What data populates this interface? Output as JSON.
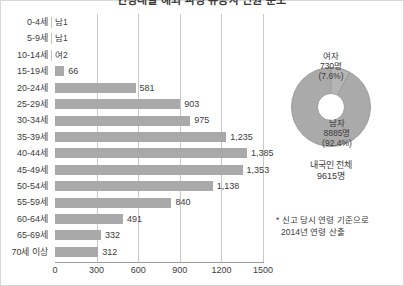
{
  "chart_data": {
    "type": "bar",
    "title": "연령대별 해외 파병 유공자 인원 분포",
    "orientation": "horizontal",
    "xlabel": "",
    "ylabel": "",
    "xlim": [
      0,
      1500
    ],
    "xticks": [
      0,
      300,
      600,
      900,
      1200,
      1500
    ],
    "xtick_labels": [
      "0",
      "300",
      "600",
      "900",
      "1200",
      "1500"
    ],
    "grid": true,
    "legend": "none",
    "bar_color": "#a9a9a9",
    "categories": [
      "0-4세",
      "5-9세",
      "10-14세",
      "15-19세",
      "20-24세",
      "25-29세",
      "30-34세",
      "35-39세",
      "40-44세",
      "45-49세",
      "50-54세",
      "55-59세",
      "60-64세",
      "65-69세",
      "70세 이상"
    ],
    "values": [
      1,
      1,
      2,
      66,
      581,
      903,
      975,
      1235,
      1385,
      1353,
      1138,
      840,
      491,
      332,
      312
    ],
    "value_labels": [
      "남1",
      "남1",
      "여2",
      "66",
      "581",
      "903",
      "975",
      "1,235",
      "1,385",
      "1,353",
      "1,138",
      "840",
      "491",
      "332",
      "312"
    ]
  },
  "donut": {
    "type": "pie",
    "title": "내국인 전체",
    "total_label": "9615명",
    "color": "#aaaaaa",
    "slices": [
      {
        "name": "여자",
        "count_label": "730명",
        "percent_label": "(7.6%)",
        "value": 7.6
      },
      {
        "name": "남자",
        "count_label": "8885명",
        "percent_label": "(92.4%)",
        "value": 92.4
      }
    ]
  },
  "footnote": {
    "line1": "* 신고 당시 연령 기준으로",
    "line2": "2014년 연령 산출"
  }
}
